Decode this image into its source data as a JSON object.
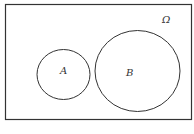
{
  "diagram": {
    "type": "venn",
    "universe_label": "Ω",
    "sets": [
      {
        "label": "A"
      },
      {
        "label": "B"
      }
    ],
    "relationship": "disjoint"
  }
}
